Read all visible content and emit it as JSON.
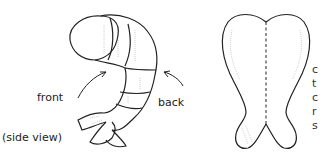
{
  "diagram": {
    "labels": {
      "front": "front",
      "back": "back",
      "side_view": "(side view)"
    },
    "truncated_text_lines": [
      "c",
      "t",
      "c",
      "r",
      "s"
    ],
    "figures": [
      {
        "name": "shrimp-side-view",
        "description": "curled shrimp body, segmented, with tail fan"
      },
      {
        "name": "shrimp-butterflied-top-view",
        "description": "heart-shaped butterflied shrimp with dashed center line"
      }
    ]
  }
}
